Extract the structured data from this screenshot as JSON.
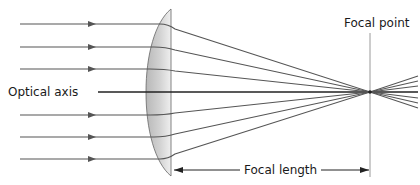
{
  "diagram": {
    "labels": {
      "optical_axis": "Optical axis",
      "focal_point": "Focal point",
      "focal_length": "Focal length"
    },
    "incoming_rays": 7,
    "ray_y_positions": [
      24,
      47,
      69,
      92,
      115,
      137,
      159
    ],
    "colors": {
      "ray": "#555555",
      "axis": "#222222",
      "lens_fill_dark": "#b5b5b5",
      "lens_fill_light": "#ececec",
      "focal_line": "#9a9a9a",
      "text": "#1a1a1a"
    }
  }
}
